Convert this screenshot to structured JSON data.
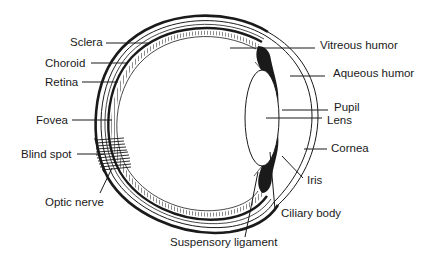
{
  "diagram": {
    "labels": {
      "sclera": "Sclera",
      "choroid": "Choroid",
      "retina": "Retina",
      "fovea": "Fovea",
      "blind_spot": "Blind spot",
      "optic_nerve": "Optic nerve",
      "vitreous_humor": "Vitreous humor",
      "aqueous_humor": "Aqueous humor",
      "pupil": "Pupil",
      "lens": "Lens",
      "cornea": "Cornea",
      "iris": "Iris",
      "ciliary_body": "Ciliary body",
      "suspensory_ligament": "Suspensory ligament"
    },
    "colors": {
      "ink": "#1a1a1a",
      "background": "#ffffff"
    }
  }
}
